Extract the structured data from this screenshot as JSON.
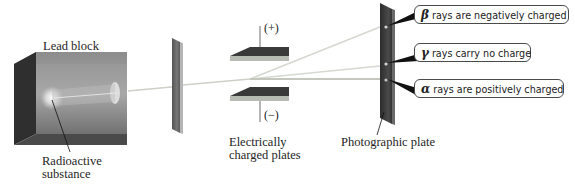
{
  "figure": {
    "colors": {
      "lead_block_front": "#6e6e6e",
      "lead_block_side": "#2e2e2e",
      "lead_block_top": "#8a8a8a",
      "slit_plate": "#6a6a6a",
      "charged_plate_top": "#3c3c3c",
      "charged_plate_edge": "#b9bdb6",
      "photo_plate": "#3a3a3a",
      "beam": "#d4d8cf",
      "callout_border": "#4a4a4a"
    }
  },
  "labels": {
    "lead_block": "Lead block",
    "radioactive_substance_line1": "Radioactive",
    "radioactive_substance_line2": "substance",
    "charged_plates_line1": "Electrically",
    "charged_plates_line2": "charged plates",
    "photographic_plate": "Photographic plate",
    "positive_terminal": "(+)",
    "negative_terminal": "(−)"
  },
  "callouts": [
    {
      "symbol": "β",
      "text": "rays are negatively charged",
      "ray": "beta"
    },
    {
      "symbol": "γ",
      "text": "rays carry no charge",
      "ray": "gamma"
    },
    {
      "symbol": "α",
      "text": "rays are positively charged",
      "ray": "alpha"
    }
  ]
}
